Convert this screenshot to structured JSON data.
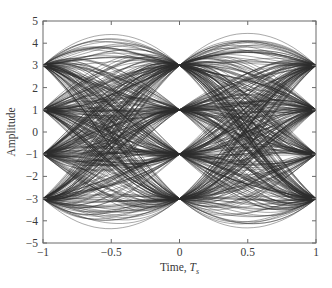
{
  "chart_data": {
    "type": "line",
    "subtype": "eye-diagram",
    "title": "",
    "xlabel": "Time, T_s",
    "xlabel_main": "Time, ",
    "xlabel_symbol": "T",
    "xlabel_subscript": "s",
    "ylabel": "Amplitude",
    "xlim": [
      -1,
      1
    ],
    "ylim": [
      -5,
      5
    ],
    "xticks": [
      -1,
      -0.5,
      0,
      0.5,
      1
    ],
    "xtick_labels": [
      "−1",
      "−0.5",
      "0",
      "0.5",
      "1"
    ],
    "yticks": [
      -5,
      -4,
      -3,
      -2,
      -1,
      0,
      1,
      2,
      3,
      4,
      5
    ],
    "ytick_labels": [
      "−5",
      "−4",
      "−3",
      "−2",
      "−1",
      "0",
      "1",
      "2",
      "3",
      "4",
      "5"
    ],
    "grid": false,
    "legend": null,
    "symbol_levels": [
      -3,
      -1,
      1,
      3
    ],
    "convergence_times": [
      -1,
      0,
      1
    ],
    "peak_overshoot": 4.1,
    "trace_count": 420,
    "trace_color": "#2b2b2b"
  }
}
